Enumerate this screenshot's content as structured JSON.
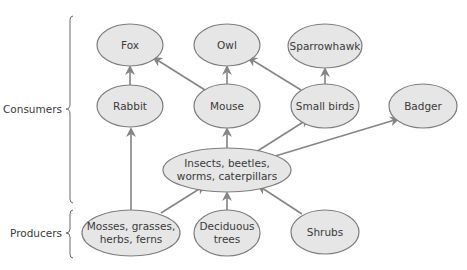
{
  "diagram": {
    "type": "food-web",
    "colors": {
      "node_fill": "#e6e6e6",
      "node_stroke": "#7d7d7d",
      "arrow": "#858585",
      "text": "#3a3a3a"
    },
    "groups": {
      "consumers": "Consumers",
      "producers": "Producers"
    },
    "nodes": {
      "fox": {
        "lines": [
          "Fox"
        ]
      },
      "owl": {
        "lines": [
          "Owl"
        ]
      },
      "sparrowhawk": {
        "lines": [
          "Sparrowhawk"
        ]
      },
      "rabbit": {
        "lines": [
          "Rabbit"
        ]
      },
      "mouse": {
        "lines": [
          "Mouse"
        ]
      },
      "small_birds": {
        "lines": [
          "Small birds"
        ]
      },
      "badger": {
        "lines": [
          "Badger"
        ]
      },
      "insects": {
        "lines": [
          "Insects, beetles,",
          "worms, caterpillars"
        ]
      },
      "mosses": {
        "lines": [
          "Mosses, grasses,",
          "herbs, ferns"
        ]
      },
      "deciduous": {
        "lines": [
          "Deciduous",
          "trees"
        ]
      },
      "shrubs": {
        "lines": [
          "Shrubs"
        ]
      }
    },
    "edges": [
      {
        "from": "Rabbit",
        "to": "Fox"
      },
      {
        "from": "Mouse",
        "to": "Fox"
      },
      {
        "from": "Mouse",
        "to": "Owl"
      },
      {
        "from": "Small birds",
        "to": "Owl"
      },
      {
        "from": "Small birds",
        "to": "Sparrowhawk"
      },
      {
        "from": "Insects, beetles, worms, caterpillars",
        "to": "Mouse"
      },
      {
        "from": "Insects, beetles, worms, caterpillars",
        "to": "Small birds"
      },
      {
        "from": "Insects, beetles, worms, caterpillars",
        "to": "Badger"
      },
      {
        "from": "Mosses, grasses, herbs, ferns",
        "to": "Rabbit"
      },
      {
        "from": "Mosses, grasses, herbs, ferns",
        "to": "Insects, beetles, worms, caterpillars"
      },
      {
        "from": "Deciduous trees",
        "to": "Insects, beetles, worms, caterpillars"
      },
      {
        "from": "Shrubs",
        "to": "Insects, beetles, worms, caterpillars"
      }
    ]
  }
}
